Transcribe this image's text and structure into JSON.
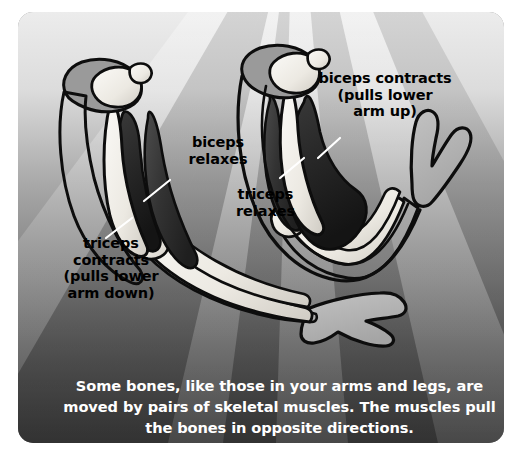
{
  "figure": {
    "kind": "anatomy-diagram",
    "background": {
      "style": "radial light rays fanning from top-center, gradient light at top to dark at bottom",
      "top_color": "#e8e8e8",
      "bottom_color": "#3b3b3b",
      "ray_light": "#d9d9d9",
      "ray_dark": "#9a9a9a"
    },
    "card": {
      "corner_radius_px": 15,
      "border_color": "#ffffff"
    }
  },
  "labels": [
    {
      "id": "biceps-contracts",
      "text": "biceps contracts\n(pulls lower\narm up)",
      "color": "#000000",
      "points_to": "biceps muscle of the flexed (right) arm"
    },
    {
      "id": "biceps-relaxes",
      "text": "biceps\nrelaxes",
      "color": "#000000",
      "points_to": "biceps muscle of the extended (left) arm"
    },
    {
      "id": "triceps-relaxes",
      "text": "triceps\nrelaxes",
      "color": "#000000",
      "points_to": "triceps muscle of the flexed (right) arm"
    },
    {
      "id": "triceps-contracts",
      "text": "triceps\ncontracts\n(pulls lower\narm down)",
      "color": "#000000",
      "points_to": "triceps muscle of the extended (left) arm"
    }
  ],
  "caption": {
    "text": "Some bones, like those in your arms and legs, are\nmoved by pairs of skeletal muscles.  The muscles pull\nthe bones in opposite directions.",
    "color": "#ffffff"
  },
  "arms": [
    {
      "id": "extended-arm",
      "position": "left",
      "state": "extended / arm down",
      "biceps_state": "relaxes",
      "triceps_state": "contracts"
    },
    {
      "id": "flexed-arm",
      "position": "right",
      "state": "flexed / arm up",
      "biceps_state": "contracts",
      "triceps_state": "relaxes"
    }
  ],
  "palette": {
    "bone_light": "#f2f0ec",
    "bone_shadow": "#cfcbc4",
    "muscle_dark": "#2b2b2b",
    "muscle_mid": "#4a4a4a",
    "hand_gray": "#b3b3b3",
    "outline": "#0d0d0d"
  }
}
